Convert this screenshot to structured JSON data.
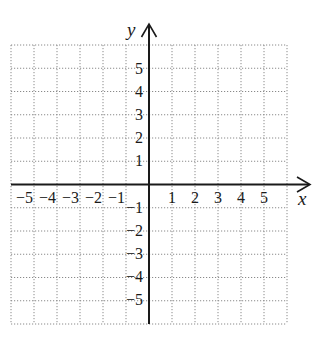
{
  "diagram": {
    "type": "coordinate-plane",
    "x_axis_label": "x",
    "y_axis_label": "y",
    "x_range": [
      -6,
      6
    ],
    "y_range": [
      -6,
      6
    ],
    "grid": "dotted, 1 unit",
    "x_tick_labels": [
      "−5",
      "−4",
      "−3",
      "−2",
      "−1",
      "1",
      "2",
      "3",
      "4",
      "5"
    ],
    "y_tick_labels": [
      "5",
      "4",
      "3",
      "2",
      "1",
      "−1",
      "−2",
      "−3",
      "−4",
      "−5"
    ],
    "colors": {
      "axis": "#1a1a1a",
      "grid": "#8a8a8a",
      "background": "#ffffff"
    }
  },
  "labels": {
    "x": "x",
    "y": "y",
    "xn5": "−5",
    "xn4": "−4",
    "xn3": "−3",
    "xn2": "−2",
    "xn1": "−1",
    "xp1": "1",
    "xp2": "2",
    "xp3": "3",
    "xp4": "4",
    "xp5": "5",
    "yp5": "5",
    "yp4": "4",
    "yp3": "3",
    "yp2": "2",
    "yp1": "1",
    "yn1": "−1",
    "yn2": "−2",
    "yn3": "−3",
    "yn4": "−4",
    "yn5": "−5"
  }
}
